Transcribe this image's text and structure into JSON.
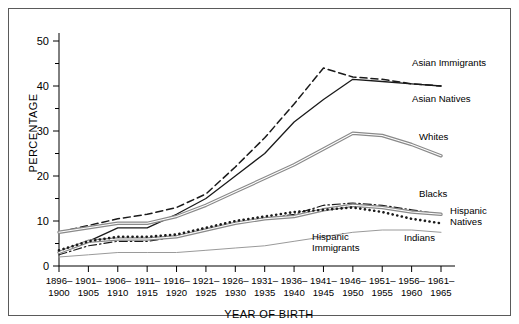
{
  "figure": {
    "border_color": "#5a5a5a",
    "background": "#ffffff"
  },
  "axes": {
    "ylabel": "PERCENTAGE",
    "xlabel": "YEAR OF BIRTH",
    "ytick_labels": [
      "0",
      "10",
      "20",
      "30",
      "40",
      "50"
    ],
    "xtick_labels_top": [
      "1896–",
      "1901–",
      "1906–",
      "1911–",
      "1916–",
      "1921–",
      "1926–",
      "1931–",
      "1936–",
      "1941–",
      "1946–",
      "1951–",
      "1956–",
      "1961–"
    ],
    "xtick_labels_bottom": [
      "1900",
      "1905",
      "1910",
      "1915",
      "1920",
      "1925",
      "1930",
      "1935",
      "1940",
      "1945",
      "1950",
      "1955",
      "1960",
      "1965"
    ]
  },
  "chart_data": {
    "type": "line",
    "title": "",
    "xlabel": "YEAR OF BIRTH",
    "ylabel": "PERCENTAGE",
    "ylim": [
      0,
      50
    ],
    "yticks": [
      0,
      10,
      20,
      30,
      40,
      50
    ],
    "yminor_ticks": [
      5,
      15,
      25,
      35,
      45
    ],
    "grid": false,
    "legend": "inline-right-annotations",
    "categories": [
      "1896-1900",
      "1901-1905",
      "1906-1910",
      "1911-1915",
      "1916-1920",
      "1921-1925",
      "1926-1930",
      "1931-1935",
      "1936-1940",
      "1941-1945",
      "1946-1950",
      "1951-1955",
      "1956-1960",
      "1961-1965"
    ],
    "series": [
      {
        "name": "Asian Immigrants",
        "style": "dashed",
        "color": "#1a1a1a",
        "label_position": "right-top",
        "values": [
          7.5,
          9.0,
          10.5,
          11.5,
          13.0,
          16.0,
          22.0,
          28.5,
          36.0,
          44.0,
          42.0,
          41.5,
          40.5,
          40.0
        ]
      },
      {
        "name": "Asian Natives",
        "style": "solid",
        "color": "#1a1a1a",
        "label_position": "right",
        "values": [
          3.0,
          5.5,
          8.5,
          8.5,
          11.5,
          15.0,
          20.0,
          25.0,
          32.0,
          37.0,
          41.5,
          41.0,
          40.5,
          40.0
        ]
      },
      {
        "name": "Whites",
        "style": "double",
        "color": "#8a8a8a",
        "label_position": "right",
        "values": [
          7.5,
          8.5,
          9.5,
          9.5,
          11.0,
          13.5,
          16.5,
          19.5,
          22.5,
          26.0,
          29.5,
          29.0,
          27.0,
          24.5
        ]
      },
      {
        "name": "Blacks",
        "style": "dashdot",
        "color": "#1a1a1a",
        "label_position": "right",
        "values": [
          2.5,
          4.5,
          5.5,
          5.5,
          6.5,
          8.0,
          9.5,
          10.5,
          11.5,
          13.5,
          14.0,
          13.5,
          12.5,
          11.5
        ]
      },
      {
        "name": "Hispanic Natives",
        "style": "double",
        "color": "#8a8a8a",
        "label_position": "right",
        "values": [
          3.0,
          5.5,
          6.0,
          6.0,
          6.5,
          8.0,
          9.5,
          10.5,
          11.0,
          12.5,
          13.5,
          13.0,
          12.0,
          11.5
        ]
      },
      {
        "name": "Indians",
        "style": "dotted",
        "color": "#1a1a1a",
        "label_position": "right-lower",
        "values": [
          3.5,
          5.5,
          6.5,
          6.5,
          7.0,
          8.5,
          10.0,
          11.0,
          12.0,
          12.5,
          13.0,
          12.0,
          10.5,
          9.5
        ]
      },
      {
        "name": "Hispanic Immigrants",
        "style": "thin-solid",
        "color": "#9a9a9a",
        "label_position": "bottom-right",
        "values": [
          2.0,
          2.5,
          3.0,
          3.0,
          3.0,
          3.5,
          4.0,
          4.5,
          5.5,
          6.5,
          7.5,
          8.0,
          8.0,
          7.5
        ]
      }
    ],
    "annotations": [
      {
        "text": "Asian Immigrants",
        "x": 411,
        "y": 65
      },
      {
        "text": "Asian Natives",
        "x": 411,
        "y": 101
      },
      {
        "text": "Whites",
        "x": 418,
        "y": 139
      },
      {
        "text": "Blacks",
        "x": 418,
        "y": 196
      },
      {
        "text": "Hispanic",
        "x": 449,
        "y": 213
      },
      {
        "text": "Natives",
        "x": 449,
        "y": 224
      },
      {
        "text": "Indians",
        "x": 403,
        "y": 240
      },
      {
        "text": "Hispanic",
        "x": 311,
        "y": 239
      },
      {
        "text": "Immigrants",
        "x": 311,
        "y": 250
      }
    ]
  }
}
